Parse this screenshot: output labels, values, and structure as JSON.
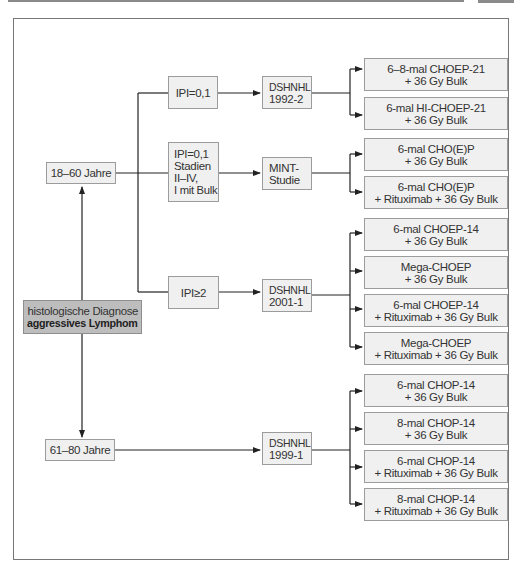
{
  "diagram": {
    "root": {
      "line1": "histologische Diagnose",
      "line2": "aggressives Lymphom"
    },
    "age_groups": [
      {
        "label": "18–60 Jahre"
      },
      {
        "label": "61–80 Jahre"
      }
    ],
    "criteria": [
      {
        "lines": [
          "IPI=0,1"
        ]
      },
      {
        "lines": [
          "IPI=0,1",
          "Stadien",
          "II–IV,",
          "I mit Bulk"
        ]
      },
      {
        "lines": [
          "IPI≥2"
        ]
      }
    ],
    "studies": [
      {
        "lines": [
          "DSHNHL",
          "1992-2"
        ]
      },
      {
        "lines": [
          "MINT-",
          "Studie"
        ]
      },
      {
        "lines": [
          "DSHNHL",
          "2001-1"
        ]
      },
      {
        "lines": [
          "DSHNHL",
          "1999-1"
        ]
      }
    ],
    "arms": [
      {
        "study": "DSHNHL 1992-2",
        "lines": [
          "6–8-mal CHOEP-21",
          "+ 36 Gy Bulk"
        ]
      },
      {
        "study": "DSHNHL 1992-2",
        "lines": [
          "6-mal HI-CHOEP-21",
          "+ 36 Gy Bulk"
        ]
      },
      {
        "study": "MINT-Studie",
        "lines": [
          "6-mal CHO(E)P",
          "+ 36 Gy Bulk"
        ]
      },
      {
        "study": "MINT-Studie",
        "lines": [
          "6-mal CHO(E)P",
          "+ Rituximab + 36 Gy Bulk"
        ]
      },
      {
        "study": "DSHNHL 2001-1",
        "lines": [
          "6-mal CHOEP-14",
          "+ 36 Gy Bulk"
        ]
      },
      {
        "study": "DSHNHL 2001-1",
        "lines": [
          "Mega-CHOEP",
          "+ 36 Gy Bulk"
        ]
      },
      {
        "study": "DSHNHL 2001-1",
        "lines": [
          "6-mal CHOEP-14",
          "+ Rituximab + 36 Gy Bulk"
        ]
      },
      {
        "study": "DSHNHL 2001-1",
        "lines": [
          "Mega-CHOEP",
          "+ Rituximab + 36 Gy Bulk"
        ]
      },
      {
        "study": "DSHNHL 1999-1",
        "lines": [
          "6-mal CHOP-14",
          "+ 36 Gy Bulk"
        ]
      },
      {
        "study": "DSHNHL 1999-1",
        "lines": [
          "8-mal CHOP-14",
          "+ 36 Gy Bulk"
        ]
      },
      {
        "study": "DSHNHL 1999-1",
        "lines": [
          "6-mal CHOP-14",
          "+ Rituximab + 36 Gy Bulk"
        ]
      },
      {
        "study": "DSHNHL 1999-1",
        "lines": [
          "8-mal CHOP-14",
          "+ Rituximab + 36 Gy Bulk"
        ]
      }
    ]
  }
}
